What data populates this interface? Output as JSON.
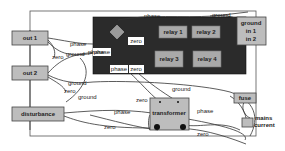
{
  "diagram": {
    "colors": {
      "background": "#ffffff",
      "frame": "#555555",
      "box_fill": "#bdbdbd",
      "panel_fill": "#2b2b2b",
      "relay_fill": "#a9a9a9",
      "diamond_fill": "#9a9a9a",
      "terminal_fill": "#111111",
      "wire": "#333333"
    },
    "nodes": {
      "out1": "out 1",
      "out2": "out 2",
      "disturbance": "disturbance",
      "relay1": "relay 1",
      "relay2": "relay 2",
      "relay3": "relay 3",
      "relay4": "relay 4",
      "ground_in": {
        "line1": "ground",
        "line2": "in 1",
        "line3": "in 2"
      },
      "transformer": "transformer",
      "fuse": "fuse",
      "mains_current": {
        "line1": "mains",
        "line2": "current"
      }
    },
    "panel_tags": {
      "zero_top": "zero",
      "phase_left": "phase",
      "phase_bottom": "phase",
      "zero_bottom": "zero"
    },
    "wire_labels": {
      "phase_top": "phase",
      "ground_top": "ground",
      "out1_phase": "phase",
      "out1_zero": "zero",
      "out1_ground": "ground",
      "out2_phase": "phase",
      "out2_ground": "ground",
      "out2_zero": "zero",
      "dist_ground": "ground",
      "dist_phase": "phase",
      "dist_zero": "zero",
      "zero_mid": "zero",
      "ground_transformer": "ground",
      "transformer_phase": "phase",
      "zero_bottom_wire": "zero"
    }
  }
}
